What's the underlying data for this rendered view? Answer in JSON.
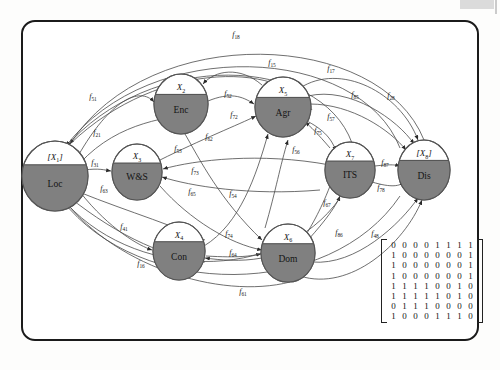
{
  "figure": {
    "frame_color": "#1b1b1b",
    "node_fill": "#808080",
    "node_stroke": "#555555",
    "edge_color": "#4a4a4a"
  },
  "nodes": [
    {
      "id": "loc",
      "var": "[X",
      "sub": "1",
      "var_close": "]",
      "name": "Loc",
      "cx": 55,
      "cy": 176,
      "rx": 33,
      "ry": 35,
      "bracketed": true
    },
    {
      "id": "enc",
      "var": "X",
      "sub": "2",
      "var_close": "",
      "name": "Enc",
      "cx": 181,
      "cy": 104,
      "rx": 27,
      "ry": 30,
      "bracketed": false
    },
    {
      "id": "ws",
      "var": "X",
      "sub": "3",
      "var_close": "",
      "name": "W&S",
      "cx": 137,
      "cy": 172,
      "rx": 25,
      "ry": 28,
      "bracketed": false
    },
    {
      "id": "con",
      "var": "X",
      "sub": "4",
      "var_close": "",
      "name": "Con",
      "cx": 179,
      "cy": 251,
      "rx": 26,
      "ry": 29,
      "bracketed": false
    },
    {
      "id": "agr",
      "var": "X",
      "sub": "5",
      "var_close": "",
      "name": "Agr",
      "cx": 283,
      "cy": 107,
      "rx": 28,
      "ry": 30,
      "bracketed": false
    },
    {
      "id": "dom",
      "var": "X",
      "sub": "6",
      "var_close": "",
      "name": "Dom",
      "cx": 288,
      "cy": 253,
      "rx": 27,
      "ry": 29,
      "bracketed": false
    },
    {
      "id": "its",
      "var": "X",
      "sub": "7",
      "var_close": "",
      "name": "ITS",
      "cx": 350,
      "cy": 170,
      "rx": 25,
      "ry": 28,
      "bracketed": false
    },
    {
      "id": "dis",
      "var": "[X",
      "sub": "8",
      "var_close": "]",
      "name": "Dis",
      "cx": 424,
      "cy": 170,
      "rx": 26,
      "ry": 30,
      "bracketed": true
    }
  ],
  "edge_labels": [
    {
      "base": "f",
      "sub": "18",
      "x": 236,
      "y": 37
    },
    {
      "base": "f",
      "sub": "15",
      "x": 272,
      "y": 65
    },
    {
      "base": "f",
      "sub": "17",
      "x": 331,
      "y": 71
    },
    {
      "base": "f",
      "sub": "51",
      "x": 93,
      "y": 99
    },
    {
      "base": "f",
      "sub": "52",
      "x": 228,
      "y": 96
    },
    {
      "base": "f",
      "sub": "85",
      "x": 355,
      "y": 97
    },
    {
      "base": "f",
      "sub": "28",
      "x": 391,
      "y": 98
    },
    {
      "base": "f",
      "sub": "21",
      "x": 97,
      "y": 135
    },
    {
      "base": "f",
      "sub": "72",
      "x": 234,
      "y": 117
    },
    {
      "base": "f",
      "sub": "57",
      "x": 331,
      "y": 119
    },
    {
      "base": "f",
      "sub": "62",
      "x": 209,
      "y": 139
    },
    {
      "base": "f",
      "sub": "53",
      "x": 178,
      "y": 151
    },
    {
      "base": "f",
      "sub": "75",
      "x": 318,
      "y": 133
    },
    {
      "base": "f",
      "sub": "56",
      "x": 296,
      "y": 152
    },
    {
      "base": "f",
      "sub": "31",
      "x": 95,
      "y": 165
    },
    {
      "base": "f",
      "sub": "73",
      "x": 195,
      "y": 173
    },
    {
      "base": "f",
      "sub": "87",
      "x": 385,
      "y": 165
    },
    {
      "base": "f",
      "sub": "63",
      "x": 104,
      "y": 191
    },
    {
      "base": "f",
      "sub": "65",
      "x": 192,
      "y": 194
    },
    {
      "base": "f",
      "sub": "54",
      "x": 233,
      "y": 196
    },
    {
      "base": "f",
      "sub": "78",
      "x": 381,
      "y": 190
    },
    {
      "base": "f",
      "sub": "67",
      "x": 327,
      "y": 205
    },
    {
      "base": "f",
      "sub": "41",
      "x": 124,
      "y": 229
    },
    {
      "base": "f",
      "sub": "74",
      "x": 229,
      "y": 236
    },
    {
      "base": "f",
      "sub": "86",
      "x": 339,
      "y": 235
    },
    {
      "base": "f",
      "sub": "48",
      "x": 375,
      "y": 236
    },
    {
      "base": "f",
      "sub": "64",
      "x": 233,
      "y": 255
    },
    {
      "base": "f",
      "sub": "16",
      "x": 141,
      "y": 266
    },
    {
      "base": "f",
      "sub": "61",
      "x": 243,
      "y": 294
    }
  ],
  "matrix": {
    "label": "adjacency-matrix",
    "rows": [
      [
        "0",
        "0",
        "0",
        "0",
        "1",
        "1",
        "1",
        "1"
      ],
      [
        "1",
        "0",
        "0",
        "0",
        "0",
        "0",
        "0",
        "1"
      ],
      [
        "1",
        "0",
        "0",
        "0",
        "0",
        "0",
        "0",
        "1"
      ],
      [
        "1",
        "0",
        "0",
        "0",
        "0",
        "0",
        "0",
        "1"
      ],
      [
        "1",
        "1",
        "1",
        "1",
        "0",
        "0",
        "1",
        "0"
      ],
      [
        "1",
        "1",
        "1",
        "1",
        "1",
        "0",
        "1",
        "0"
      ],
      [
        "0",
        "1",
        "1",
        "1",
        "0",
        "0",
        "0",
        "0"
      ],
      [
        "1",
        "0",
        "0",
        "0",
        "1",
        "1",
        "1",
        "0"
      ]
    ]
  }
}
